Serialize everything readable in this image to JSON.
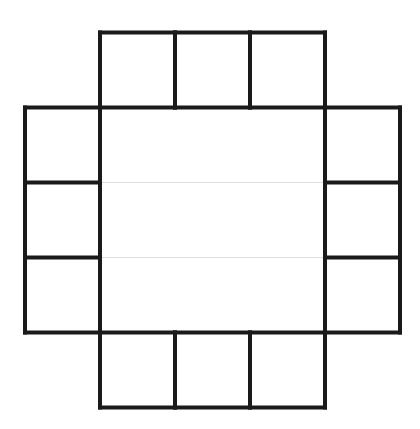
{
  "diagram": {
    "type": "cross-shaped grid",
    "grid_size": [
      5,
      5
    ],
    "colors": {
      "background": "#ffffff",
      "thick_line": "#1a1a1a",
      "thin_line": "#7a7a7a"
    },
    "cells": [
      {
        "row": 0,
        "col": 1,
        "region": "top"
      },
      {
        "row": 0,
        "col": 2,
        "region": "top"
      },
      {
        "row": 0,
        "col": 3,
        "region": "top"
      },
      {
        "row": 1,
        "col": 0,
        "region": "left"
      },
      {
        "row": 2,
        "col": 0,
        "region": "left"
      },
      {
        "row": 3,
        "col": 0,
        "region": "left"
      },
      {
        "row": 1,
        "col": 4,
        "region": "right"
      },
      {
        "row": 2,
        "col": 4,
        "region": "right"
      },
      {
        "row": 3,
        "col": 4,
        "region": "right"
      },
      {
        "row": 4,
        "col": 1,
        "region": "bottom"
      },
      {
        "row": 4,
        "col": 2,
        "region": "bottom"
      },
      {
        "row": 4,
        "col": 3,
        "region": "bottom"
      },
      {
        "row": 1,
        "col": 1,
        "region": "center"
      },
      {
        "row": 1,
        "col": 2,
        "region": "center"
      },
      {
        "row": 1,
        "col": 3,
        "region": "center"
      },
      {
        "row": 2,
        "col": 1,
        "region": "center"
      },
      {
        "row": 2,
        "col": 2,
        "region": "center"
      },
      {
        "row": 2,
        "col": 3,
        "region": "center"
      },
      {
        "row": 3,
        "col": 1,
        "region": "center"
      },
      {
        "row": 3,
        "col": 2,
        "region": "center"
      },
      {
        "row": 3,
        "col": 3,
        "region": "center"
      }
    ]
  }
}
